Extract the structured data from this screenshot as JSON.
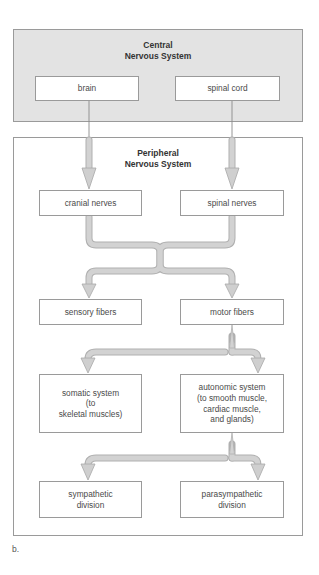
{
  "diagram": {
    "central": {
      "title_line1": "Central",
      "title_line2": "Nervous System",
      "nodes": {
        "brain": "brain",
        "spinal_cord": "spinal cord"
      }
    },
    "peripheral": {
      "title_line1": "Peripheral",
      "title_line2": "Nervous System",
      "nodes": {
        "cranial_nerves": "cranial nerves",
        "spinal_nerves": "spinal nerves",
        "sensory_fibers": "sensory fibers",
        "motor_fibers": "motor fibers",
        "somatic_system": "somatic system\n(to\nskeletal muscles)",
        "autonomic_system": "autonomic system\n(to smooth muscle,\ncardiac muscle,\nand glands)",
        "sympathetic_division": "sympathetic\ndivision",
        "parasympathetic_division": "parasympathetic\ndivision"
      }
    },
    "edges": [
      [
        "brain",
        "cranial_nerves"
      ],
      [
        "spinal_cord",
        "spinal_nerves"
      ],
      [
        "cranial_nerves + spinal_nerves",
        "sensory_fibers"
      ],
      [
        "cranial_nerves + spinal_nerves",
        "motor_fibers"
      ],
      [
        "motor_fibers",
        "somatic_system"
      ],
      [
        "motor_fibers",
        "autonomic_system"
      ],
      [
        "autonomic_system",
        "sympathetic_division"
      ],
      [
        "autonomic_system",
        "parasympathetic_division"
      ]
    ],
    "colors": {
      "cns_fill": "#e3e3e3",
      "border": "#9a9a9a",
      "arrow_fill": "#cfcfcf",
      "arrow_stroke": "#a8a8a8"
    },
    "caption": "b."
  }
}
